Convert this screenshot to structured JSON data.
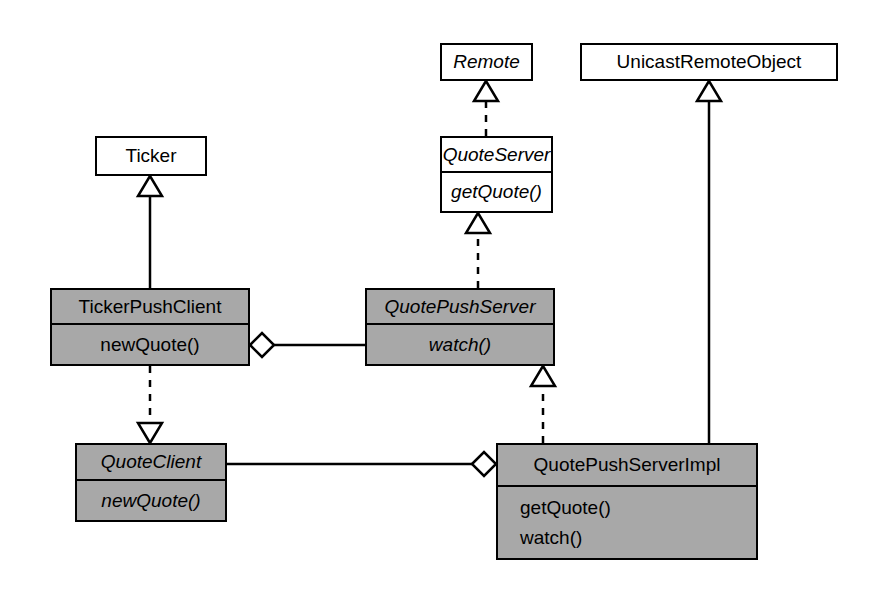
{
  "diagram": {
    "kind": "uml-class-diagram",
    "width": 872,
    "height": 590,
    "background_color": "#ffffff",
    "line_color": "#000000",
    "shaded_fill": "#a8a8a8",
    "plain_fill": "#ffffff"
  },
  "classes": [
    {
      "id": "remote",
      "name": "Remote",
      "italic_name": true,
      "shaded": false,
      "members": [],
      "box": {
        "x": 440,
        "y": 43,
        "w": 93,
        "h": 38
      }
    },
    {
      "id": "unicast-remote-object",
      "name": "UnicastRemoteObject",
      "italic_name": false,
      "shaded": false,
      "members": [],
      "box": {
        "x": 580,
        "y": 43,
        "w": 258,
        "h": 38
      }
    },
    {
      "id": "ticker",
      "name": "Ticker",
      "italic_name": false,
      "shaded": false,
      "members": [],
      "box": {
        "x": 95,
        "y": 136,
        "w": 112,
        "h": 40
      }
    },
    {
      "id": "quote-server",
      "name": "QuoteServer",
      "italic_name": true,
      "shaded": false,
      "members": [
        {
          "label": "getQuote()",
          "italic": true
        }
      ],
      "box": {
        "x": 440,
        "y": 136,
        "w": 113,
        "h": 77
      }
    },
    {
      "id": "ticker-push-client",
      "name": "TickerPushClient",
      "italic_name": false,
      "shaded": true,
      "members": [
        {
          "label": "newQuote()",
          "italic": false
        }
      ],
      "box": {
        "x": 50,
        "y": 288,
        "w": 200,
        "h": 78
      }
    },
    {
      "id": "quote-push-server",
      "name": "QuotePushServer",
      "italic_name": true,
      "shaded": true,
      "members": [
        {
          "label": "watch()",
          "italic": true
        }
      ],
      "box": {
        "x": 365,
        "y": 288,
        "w": 190,
        "h": 78
      }
    },
    {
      "id": "quote-client",
      "name": "QuoteClient",
      "italic_name": true,
      "shaded": true,
      "members": [
        {
          "label": "newQuote()",
          "italic": true
        }
      ],
      "box": {
        "x": 75,
        "y": 443,
        "w": 152,
        "h": 79
      }
    },
    {
      "id": "quote-push-server-impl",
      "name": "QuotePushServerImpl",
      "italic_name": false,
      "shaded": true,
      "members": [
        {
          "label": "getQuote()",
          "italic": false
        },
        {
          "label": "watch()",
          "italic": false
        }
      ],
      "box": {
        "x": 496,
        "y": 443,
        "w": 262,
        "h": 117
      }
    }
  ],
  "relationships": [
    {
      "id": "quoteserver-realizes-remote",
      "type": "realization",
      "line_style": "dashed",
      "marker": "hollow-triangle",
      "from": "quote-server",
      "to": "remote",
      "direction": "up"
    },
    {
      "id": "quotepushserver-realizes-quoteserver",
      "type": "realization",
      "line_style": "dashed",
      "marker": "hollow-triangle",
      "from": "quote-push-server",
      "to": "quote-server",
      "direction": "up"
    },
    {
      "id": "tickerpushclient-extends-ticker",
      "type": "generalization",
      "line_style": "solid",
      "marker": "hollow-triangle",
      "from": "ticker-push-client",
      "to": "ticker",
      "direction": "up"
    },
    {
      "id": "tickerpushclient-realizes-quoteclient",
      "type": "realization",
      "line_style": "dashed",
      "marker": "hollow-triangle",
      "from": "ticker-push-client",
      "to": "quote-client",
      "direction": "down"
    },
    {
      "id": "quotepushserverimpl-realizes-quotepushserver",
      "type": "realization",
      "line_style": "dashed",
      "marker": "hollow-triangle",
      "from": "quote-push-server-impl",
      "to": "quote-push-server",
      "direction": "up"
    },
    {
      "id": "quotepushserverimpl-extends-unicastremoteobject",
      "type": "generalization",
      "line_style": "solid",
      "marker": "hollow-triangle",
      "from": "quote-push-server-impl",
      "to": "unicast-remote-object",
      "direction": "up"
    },
    {
      "id": "tickerpushclient-aggregates-quotepushserver",
      "type": "aggregation",
      "line_style": "solid",
      "marker": "hollow-diamond",
      "from": "ticker-push-client",
      "to": "quote-push-server",
      "direction": "right"
    },
    {
      "id": "quotepushserverimpl-aggregates-quoteclient",
      "type": "aggregation",
      "line_style": "solid",
      "marker": "hollow-diamond",
      "from": "quote-push-server-impl",
      "to": "quote-client",
      "direction": "left"
    }
  ]
}
